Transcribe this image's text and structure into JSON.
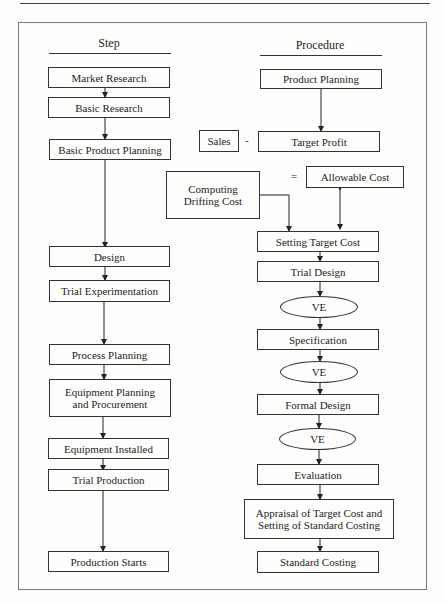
{
  "headers": {
    "left": "Step",
    "right": "Procedure"
  },
  "steps": [
    {
      "label": "Market Research"
    },
    {
      "label": "Basic Research"
    },
    {
      "label": "Basic Product Planning"
    },
    {
      "label": "Design"
    },
    {
      "label": "Trial Experimentation"
    },
    {
      "label": "Process Planning"
    },
    {
      "label": "Equipment Planning and Procurement"
    },
    {
      "label": "Equipment Installed"
    },
    {
      "label": "Trial Production"
    },
    {
      "label": "Production Starts"
    }
  ],
  "procedure": {
    "product_planning": "Product Planning",
    "sales": "Sales",
    "minus": "-",
    "target_profit": "Target Profit",
    "equals": "=",
    "allowable_cost": "Allowable Cost",
    "computing_drifting_cost": "Computing Drifting Cost",
    "setting_target_cost": "Setting Target Cost",
    "trial_design": "Trial Design",
    "ve1": "VE",
    "specification": "Specification",
    "ve2": "VE",
    "formal_design": "Formal Design",
    "ve3": "VE",
    "evaluation": "Evaluation",
    "appraisal": "Appraisal of Target Cost and Setting of Standard Costing",
    "standard_costing": "Standard Costing"
  }
}
